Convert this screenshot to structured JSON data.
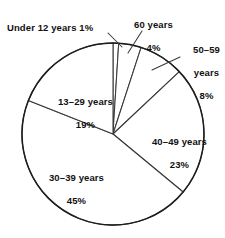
{
  "chart_data": {
    "type": "pie",
    "title": "",
    "xlabel": "",
    "ylabel": "",
    "legend_position": "none",
    "grid": false,
    "units": "percent",
    "total": 100,
    "start_angle_deg": 0,
    "direction": "clockwise",
    "categories": [
      "Under 12 years",
      "60 years",
      "50-59 years",
      "40-49 years",
      "30-39 years",
      "13-29 years"
    ],
    "values": [
      1,
      4,
      8,
      23,
      45,
      19
    ],
    "slices": [
      {
        "label": "Under 12 years",
        "value": 1,
        "percent_text": "1%",
        "label_text": "Under 12 years 1%",
        "color": "#ffffff",
        "stroke": "#3a3a3a",
        "has_leader_line": true
      },
      {
        "label": "60 years",
        "value": 4,
        "percent_text": "4%",
        "label_line1": "60 years",
        "label_line2": "4%",
        "color": "#ffffff",
        "stroke": "#3a3a3a",
        "has_leader_line": true
      },
      {
        "label": "50-59 years",
        "value": 8,
        "percent_text": "8%",
        "label_line1": "50–59",
        "label_line2": "years",
        "label_line3": "8%",
        "color": "#ffffff",
        "stroke": "#3a3a3a",
        "has_leader_line": true
      },
      {
        "label": "40-49 years",
        "value": 23,
        "percent_text": "23%",
        "label_line1": "40–49 years",
        "label_line2": "23%",
        "color": "#ffffff",
        "stroke": "#3a3a3a",
        "has_leader_line": false
      },
      {
        "label": "30-39 years",
        "value": 45,
        "percent_text": "45%",
        "label_line1": "30–39 years",
        "label_line2": "45%",
        "color": "#ffffff",
        "stroke": "#3a3a3a",
        "has_leader_line": false
      },
      {
        "label": "13-29 years",
        "value": 19,
        "percent_text": "19%",
        "label_line1": "13–29 years",
        "label_line2": "19%",
        "color": "#ffffff",
        "stroke": "#3a3a3a",
        "has_leader_line": false
      }
    ],
    "geometry": {
      "center_x": 113,
      "center_y": 134,
      "radius": 91
    },
    "style": {
      "background": "#ffffff",
      "outline_color": "#1d1d1d",
      "divider_color": "#3a3a3a",
      "text_color": "#111111"
    }
  }
}
